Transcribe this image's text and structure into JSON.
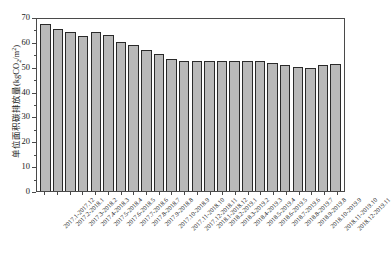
{
  "chart_data": {
    "type": "bar",
    "title": "",
    "subtitle": "",
    "xlabel": "",
    "ylabel": "单位面积碳排放量(kgCO2/m2)",
    "ylabel_parts": {
      "prefix": "单位面积碳排放量(kgCO",
      "subscript": "2",
      "middle": "/m",
      "superscript": "2",
      "suffix": ")"
    },
    "ylim": [
      0,
      70
    ],
    "yticks": [
      0,
      10,
      20,
      30,
      40,
      50,
      60,
      70
    ],
    "ytick_labels": [
      "0",
      "10",
      "20",
      "30",
      "40",
      "50",
      "60",
      "70"
    ],
    "y_minor_ticks": [
      5,
      15,
      25,
      35,
      45,
      55,
      65
    ],
    "grid": false,
    "legend": "none",
    "bar_fill_color": "#b9b9b9",
    "bar_edge_color": "#2a2a2a",
    "axis_color": "#4a4a4a",
    "background_color": "#ffffff",
    "xtick_label_rotation": -45,
    "categories": [
      "2017.1-2017.12",
      "2017.2-2018.1",
      "2017.3-2018.2",
      "2017.4-2018.3",
      "2017.5-2018.4",
      "2017.6-2018.5",
      "2017.7-2018.6",
      "2017.8-2018.7",
      "2017.9-2018.8",
      "2017.10-2018.9",
      "2017.11-2018.10",
      "2017.12-2018.11",
      "2018.1-2018.12",
      "2018.2-2019.1",
      "2018.3-2019.2",
      "2018.4-2019.3",
      "2018.5-2019.4",
      "2018.6-2019.5",
      "2018.7-2019.6",
      "2018.8-2019.7",
      "2018.9-2019.8",
      "2018.10-2019.9",
      "2018.11-2019.10",
      "2018.12-2019.11"
    ],
    "values": [
      67.2,
      65.2,
      63.8,
      62.2,
      63.9,
      62.9,
      60.0,
      58.6,
      56.8,
      55.1,
      53.2,
      52.4,
      52.3,
      52.5,
      52.4,
      52.4,
      52.5,
      52.3,
      51.3,
      50.8,
      49.7,
      49.6,
      50.7,
      50.9
    ]
  }
}
